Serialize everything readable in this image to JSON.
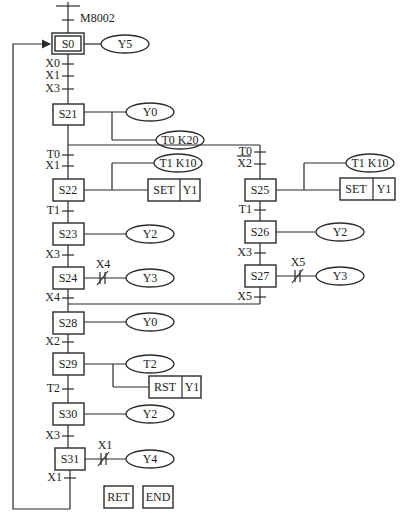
{
  "diagram": {
    "type": "sequential-function-chart",
    "init_condition": "M8002",
    "initial_step": {
      "label": "S0",
      "action": "Y5"
    },
    "transitions_to_s21": [
      "X0",
      "X1",
      "X3"
    ],
    "s21": {
      "label": "S21",
      "actions": [
        "Y0",
        "T0 K20"
      ]
    },
    "left_branch": {
      "conditions": [
        "T0",
        "X1"
      ],
      "steps": [
        {
          "label": "S22",
          "timer": "T1 K10",
          "cmd": "SET",
          "operand": "Y1"
        },
        {
          "label": "S23",
          "action": "Y2"
        },
        {
          "label": "S24",
          "contact": "X4",
          "action": "Y3"
        }
      ],
      "transitions": [
        "T1",
        "X3"
      ],
      "exit_condition": "X4"
    },
    "right_branch": {
      "conditions": [
        "T0",
        "X2"
      ],
      "steps": [
        {
          "label": "S25",
          "timer": "T1 K10",
          "cmd": "SET",
          "operand": "Y1"
        },
        {
          "label": "S26",
          "action": "Y2"
        },
        {
          "label": "S27",
          "contact": "X5",
          "action": "Y3"
        }
      ],
      "transitions": [
        "T1",
        "X3"
      ],
      "exit_condition": "X5"
    },
    "s28": {
      "label": "S28",
      "action": "Y0"
    },
    "t_s28_s29": "X2",
    "s29": {
      "label": "S29",
      "action": "T2",
      "cmd": "RST",
      "operand": "Y1"
    },
    "t_s29_s30": "T2",
    "s30": {
      "label": "S30",
      "action": "Y2"
    },
    "t_s30_s31": "X3",
    "s31": {
      "label": "S31",
      "contact": "X1",
      "action": "Y4"
    },
    "t_s31_end": "X1",
    "end_boxes": [
      "RET",
      "END"
    ]
  }
}
